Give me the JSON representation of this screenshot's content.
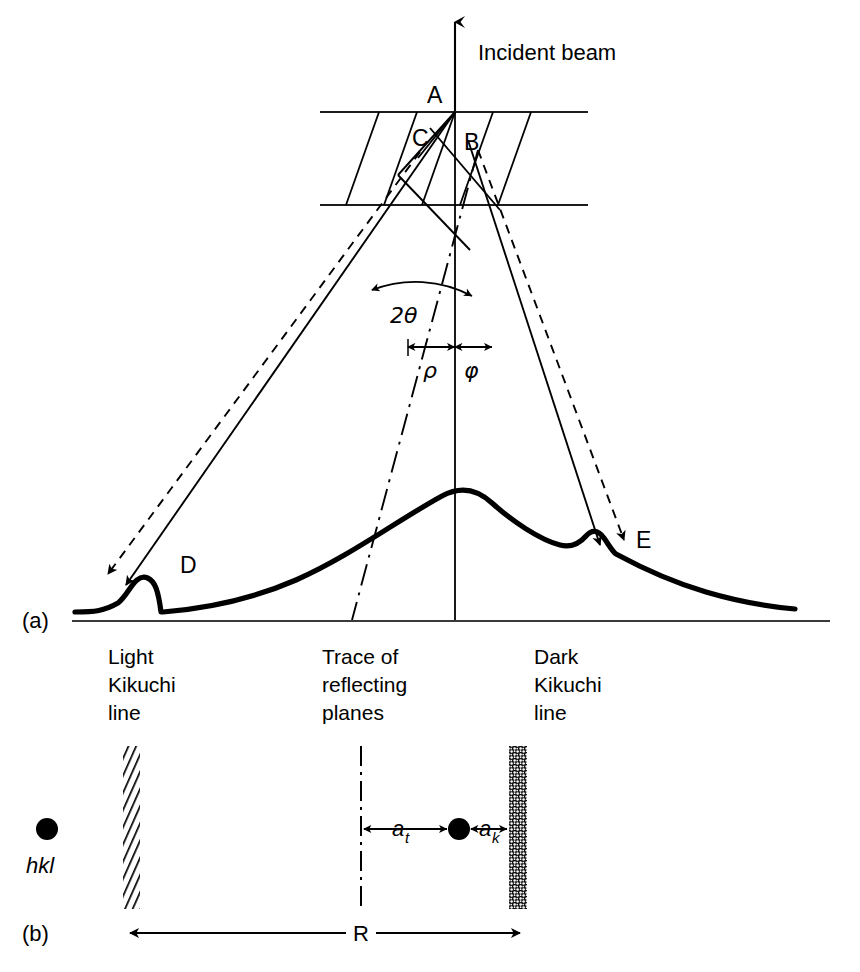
{
  "figure": {
    "panels": [
      {
        "id": "a",
        "label": "(a)"
      },
      {
        "id": "b",
        "label": "(b)"
      }
    ]
  },
  "panel_a": {
    "incident_beam_label": "Incident beam",
    "points": [
      {
        "name": "A",
        "label": "A"
      },
      {
        "name": "B",
        "label": "B"
      },
      {
        "name": "C",
        "label": "C"
      },
      {
        "name": "D",
        "label": "D"
      },
      {
        "name": "E",
        "label": "E"
      }
    ],
    "angles": {
      "two_theta": "2θ",
      "rho": "ρ",
      "phi": "φ"
    },
    "captions": [
      {
        "name": "light-kikuchi-line",
        "lines": [
          "Light",
          "Kikuchi",
          "line"
        ]
      },
      {
        "name": "trace-of-reflecting-planes",
        "lines": [
          "Trace of",
          "reflecting",
          "planes"
        ]
      },
      {
        "name": "dark-kikuchi-line",
        "lines": [
          "Dark",
          "Kikuchi",
          "line"
        ]
      }
    ]
  },
  "panel_b": {
    "reflection_label": "hkl",
    "distances": [
      {
        "name": "a_t",
        "symbol": "a",
        "sub": "t"
      },
      {
        "name": "a_k",
        "symbol": "a",
        "sub": "k"
      },
      {
        "name": "R",
        "symbol": "R",
        "sub": ""
      }
    ],
    "bars": [
      {
        "name": "light-line-band",
        "fill": "hatched"
      },
      {
        "name": "dark-line-band",
        "fill": "stippled"
      }
    ]
  },
  "colors": {
    "ink": "#000000",
    "paper": "#ffffff",
    "thin_rule": "#2b2b2b"
  }
}
